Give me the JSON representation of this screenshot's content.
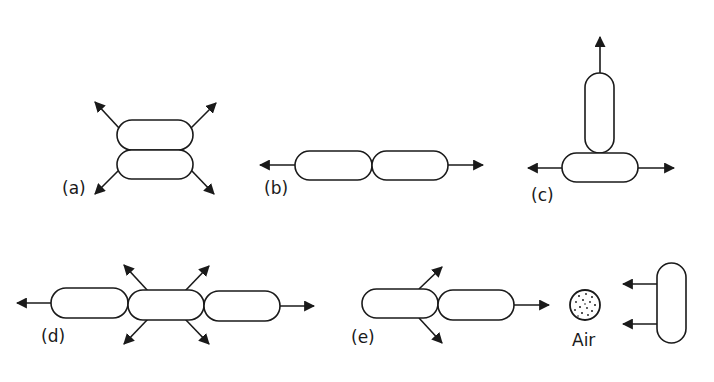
{
  "diagram": {
    "panels": [
      {
        "id": "a",
        "label": "(a)",
        "description": "Two capsules stacked vertically, four diagonal arrows outward"
      },
      {
        "id": "b",
        "label": "(b)",
        "description": "Two capsules end-to-end, arrows left and right"
      },
      {
        "id": "c",
        "label": "(c)",
        "description": "Vertical capsule on top of horizontal capsule, arrows up, left, right"
      },
      {
        "id": "d",
        "label": "(d)",
        "description": "Three capsules in a row, arrows left, right and four diagonals from middle"
      },
      {
        "id": "e",
        "label": "(e)",
        "description": "Two capsules in a row, diagonal arrows from left capsule, right arrow"
      }
    ],
    "air": {
      "label": "Air",
      "icon": "air-particles-icon"
    },
    "colors": {
      "stroke": "#1a1a1a",
      "fill": "#ffffff",
      "background": "#ffffff"
    }
  }
}
